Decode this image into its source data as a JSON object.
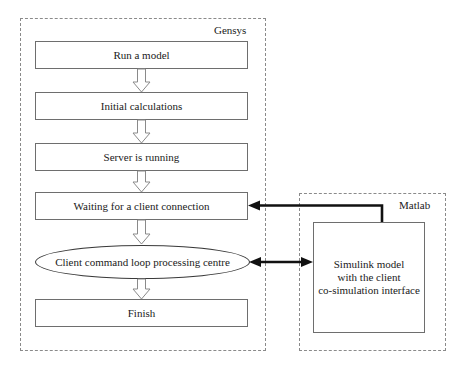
{
  "diagram": {
    "type": "flowchart",
    "groups": [
      {
        "id": "gensys",
        "label": "Gensys"
      },
      {
        "id": "matlab",
        "label": "Matlab"
      }
    ],
    "nodes": [
      {
        "id": "run-a-model",
        "shape": "rectangle",
        "label": "Run a model"
      },
      {
        "id": "initial-calculations",
        "shape": "rectangle",
        "label": "Initial calculations"
      },
      {
        "id": "server-is-running",
        "shape": "rectangle",
        "label": "Server is running"
      },
      {
        "id": "waiting-for-client",
        "shape": "rectangle",
        "label": "Waiting for a client connection"
      },
      {
        "id": "client-command-loop",
        "shape": "ellipse",
        "label": "Client command loop processing centre"
      },
      {
        "id": "finish",
        "shape": "rectangle",
        "label": "Finish"
      }
    ],
    "simulink_node": {
      "id": "simulink-model",
      "shape": "rectangle",
      "lines": [
        "Simulink model",
        "with the client",
        "co-simulation interface"
      ]
    },
    "edges": [
      {
        "from": "run-a-model",
        "to": "initial-calculations",
        "style": "hollow-block-arrow",
        "direction": "down"
      },
      {
        "from": "initial-calculations",
        "to": "server-is-running",
        "style": "hollow-block-arrow",
        "direction": "down"
      },
      {
        "from": "server-is-running",
        "to": "waiting-for-client",
        "style": "hollow-block-arrow",
        "direction": "down"
      },
      {
        "from": "waiting-for-client",
        "to": "client-command-loop",
        "style": "hollow-block-arrow",
        "direction": "down"
      },
      {
        "from": "client-command-loop",
        "to": "finish",
        "style": "hollow-block-arrow",
        "direction": "down"
      },
      {
        "from": "simulink-model",
        "to": "waiting-for-client",
        "style": "thick-solid",
        "direction": "left",
        "routing": "up-then-left"
      },
      {
        "from": "client-command-loop",
        "to": "simulink-model",
        "style": "thick-solid",
        "direction": "both",
        "routing": "straight"
      }
    ],
    "colors": {
      "background": "#ffffff",
      "node_stroke": "#6e6e6e",
      "ellipse_stroke": "#3a3a3a",
      "group_stroke": "#8a8a8a",
      "thin_arrow_stroke": "#8a8a8a",
      "thick_arrow": "#111111",
      "text": "#1a1a1a"
    }
  }
}
